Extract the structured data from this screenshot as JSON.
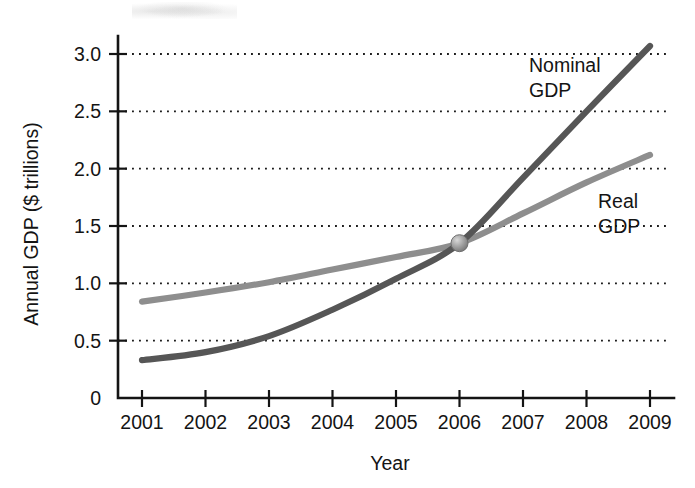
{
  "chart_data": {
    "type": "line",
    "title": "",
    "xlabel": "Year",
    "ylabel": "Annual GDP ($ trillions)",
    "x": [
      2001,
      2002,
      2003,
      2004,
      2005,
      2006,
      2007,
      2008,
      2009
    ],
    "xtick_labels": [
      "2001",
      "2002",
      "2003",
      "2004",
      "2005",
      "2006",
      "2007",
      "2008",
      "2009"
    ],
    "ytick_labels": [
      "0",
      "0.5",
      "1.0",
      "1.5",
      "2.0",
      "2.5",
      "3.0"
    ],
    "ytick_values": [
      0,
      0.5,
      1.0,
      1.5,
      2.0,
      2.5,
      3.0
    ],
    "xlim": [
      2000.7,
      2009.35
    ],
    "ylim": [
      0,
      3.15
    ],
    "grid": "horizontal-dotted",
    "legend_position": "inline-annotation",
    "series": [
      {
        "name": "Nominal GDP",
        "label": "Nominal\nGDP",
        "label_line1": "Nominal",
        "label_line2": "GDP",
        "color": "#565656",
        "stroke_width": 6.2,
        "values": [
          0.33,
          0.4,
          0.54,
          0.77,
          1.04,
          1.35,
          1.92,
          2.5,
          3.07
        ]
      },
      {
        "name": "Real GDP",
        "label": "Real\nGDP",
        "label_line1": "Real",
        "label_line2": "GDP",
        "color": "#8e8e8e",
        "stroke_width": 6.2,
        "values": [
          0.84,
          0.92,
          1.01,
          1.12,
          1.23,
          1.35,
          1.61,
          1.88,
          2.12
        ]
      }
    ],
    "annotations": [
      {
        "name": "intersection-marker",
        "shape": "sphere",
        "x": 2006,
        "y": 1.35,
        "radius": 8.5,
        "color": "#9a9a9a",
        "description": "Nominal GDP equals Real GDP in 2006"
      }
    ]
  }
}
